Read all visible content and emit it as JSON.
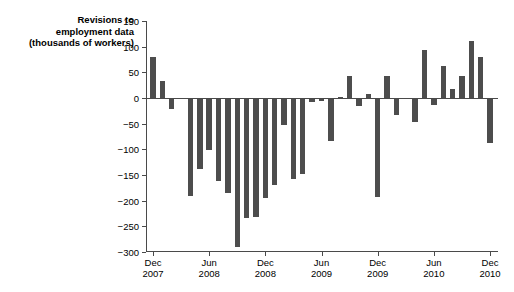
{
  "chart_data": {
    "type": "bar",
    "title": "Revisions to\nemployment data\n(thousands of workers)",
    "xlabel": "",
    "ylabel": "",
    "ylim": [
      -300,
      150
    ],
    "yticks": [
      150,
      100,
      50,
      0,
      -50,
      -100,
      -150,
      -200,
      -250,
      -300
    ],
    "ytick_labels": [
      "150",
      "100",
      "50",
      "0",
      "−50",
      "−100",
      "−150",
      "−200",
      "−250",
      "−300"
    ],
    "grid": false,
    "legend": null,
    "bar_color": "#4d4d4d",
    "xtick_labels": [
      "Dec\n2007",
      "Jun\n2008",
      "Dec\n2008",
      "Jun\n2009",
      "Dec\n2009",
      "Jun\n2010",
      "Dec\n2010"
    ],
    "xtick_categories": [
      "Dec 2007",
      "Jun 2008",
      "Dec 2008",
      "Jun 2009",
      "Dec 2009",
      "Jun 2010",
      "Dec 2010"
    ],
    "categories": [
      "Dec 2007",
      "Jan 2008",
      "Feb 2008",
      "Mar 2008",
      "Apr 2008",
      "May 2008",
      "Jun 2008",
      "Jul 2008",
      "Aug 2008",
      "Sep 2008",
      "Oct 2008",
      "Nov 2008",
      "Dec 2008",
      "Jan 2009",
      "Feb 2009",
      "Mar 2009",
      "Apr 2009",
      "May 2009",
      "Jun 2009",
      "Jul 2009",
      "Aug 2009",
      "Sep 2009",
      "Oct 2009",
      "Nov 2009",
      "Dec 2009",
      "Jan 2010",
      "Feb 2010",
      "Mar 2010",
      "Apr 2010",
      "May 2010",
      "Jun 2010",
      "Jul 2010",
      "Aug 2010",
      "Sep 2010",
      "Oct 2010",
      "Nov 2010",
      "Dec 2010"
    ],
    "values": [
      79,
      33,
      -21,
      -2,
      -190,
      -139,
      -102,
      -162,
      -185,
      -291,
      -234,
      -232,
      -195,
      -170,
      -53,
      -158,
      -148,
      -7,
      -6,
      -83,
      2,
      42,
      -16,
      8,
      -192,
      42,
      -34,
      -2,
      -47,
      94,
      -13,
      63,
      17,
      43,
      112,
      80,
      -88
    ],
    "values_label": "thousands of workers"
  }
}
